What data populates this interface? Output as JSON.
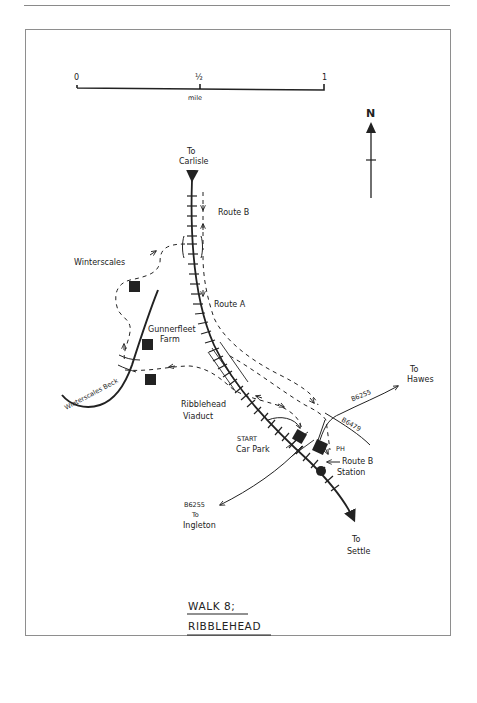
{
  "page": {
    "header_text": "",
    "background": "#ffffff",
    "ink_color": "#222222",
    "frame_color": "#8e8e8e"
  },
  "scale_bar": {
    "ticks": [
      "0",
      "½",
      "1"
    ],
    "unit": "mile"
  },
  "north_arrow": {
    "label": "N"
  },
  "title": {
    "line1": "WALK 8;",
    "line2": "RIBBLEHEAD"
  },
  "labels": {
    "to_carlisle_1": "To",
    "to_carlisle_2": "Carlisle",
    "route_b_north": "Route B",
    "route_a": "Route A",
    "winterscales": "Winterscales",
    "gunnerfleet_1": "Gunnerfleet",
    "gunnerfleet_2": "Farm",
    "winterscales_beck": "Winterscales Beck",
    "viaduct_1": "Ribblehead",
    "viaduct_2": "Viaduct",
    "start_1": "START",
    "start_2": "Car Park",
    "b6255_hawes": "B6255",
    "to_hawes_1": "To",
    "to_hawes_2": "Hawes",
    "b6479": "B6479",
    "ph": "PH",
    "route_b_station": "Route B",
    "station": "Station",
    "b6255_ingleton": "B6255",
    "to_ingleton_1": "To",
    "to_ingleton_2": "Ingleton",
    "to_settle_1": "To",
    "to_settle_2": "Settle"
  },
  "icons": {
    "building": "filled-square",
    "station": "filled-circle",
    "railway": "track-with-ties",
    "path": "dashed-line",
    "road": "solid-line"
  }
}
